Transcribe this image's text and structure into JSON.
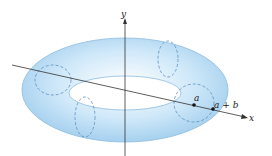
{
  "figure": {
    "labels": {
      "y_axis": "y",
      "x_axis": "x",
      "point_a": "a",
      "point_a_plus_b": "a + b"
    },
    "colors": {
      "torus_fill": "#bfe0f6",
      "torus_edge": "#7fb3da",
      "dashed": "#5a8fbf",
      "axis": "#333333",
      "point": "#111111"
    }
  }
}
